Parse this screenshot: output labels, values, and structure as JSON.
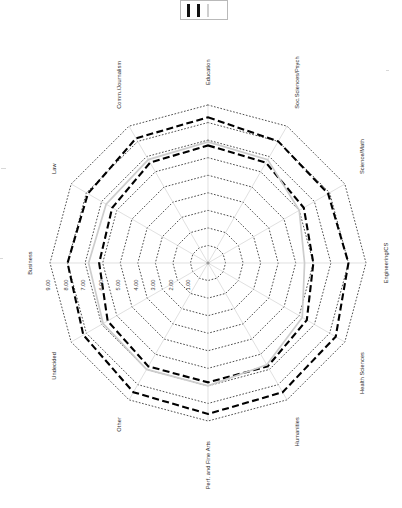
{
  "legend": {
    "items": [
      {
        "name": "series-1-swatch",
        "color": "#111111",
        "style": "dashed-black"
      },
      {
        "name": "series-2-swatch",
        "color": "#111111",
        "style": "dashed-black"
      },
      {
        "name": "series-3-swatch",
        "color": "#cfcfcf",
        "style": "solid-gray"
      }
    ]
  },
  "chart_data": {
    "type": "radar",
    "title": "",
    "xlabel": "",
    "ylabel": "",
    "grid": true,
    "legend_position": "top",
    "rlim": [
      0,
      9
    ],
    "rticks": [
      1,
      2,
      3,
      4,
      5,
      6,
      7,
      8,
      9
    ],
    "rtick_labels": [
      "1.00",
      "2.00",
      "3.00",
      "4.00",
      "5.00",
      "6.00",
      "7.00",
      "8.00",
      "9.00"
    ],
    "categories": [
      "Education",
      "Soc.Sciences/Psych",
      "Science/Math",
      "Engineering/CS",
      "Health Sciences",
      "Humanities",
      "Perf. and Fine Arts",
      "Other",
      "Undecided",
      "Business",
      "Law",
      "Comm./Journalism"
    ],
    "series": [
      {
        "name": "Series 1",
        "color": "#111111",
        "style": "dashed",
        "values": [
          8.3,
          8.0,
          7.9,
          8.0,
          8.4,
          8.5,
          8.6,
          8.5,
          8.2,
          8.0,
          7.9,
          8.2
        ]
      },
      {
        "name": "Series 2",
        "color": "#111111",
        "style": "dashed",
        "values": [
          6.7,
          6.6,
          6.3,
          6.0,
          6.5,
          6.8,
          6.8,
          6.8,
          6.6,
          6.2,
          6.3,
          6.6
        ]
      },
      {
        "name": "Series 3",
        "color": "#cdcdcd",
        "style": "solid",
        "values": [
          6.9,
          6.8,
          6.0,
          5.5,
          6.2,
          6.7,
          7.0,
          7.0,
          6.9,
          6.8,
          6.7,
          6.8
        ]
      }
    ]
  }
}
